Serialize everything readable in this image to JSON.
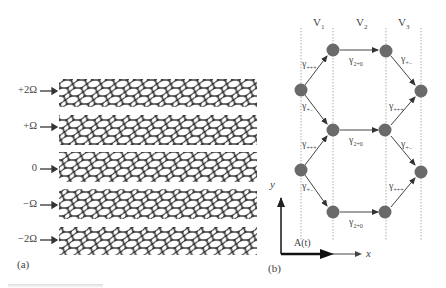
{
  "panel_a": {
    "label": "(a)",
    "sheets": [
      {
        "label": "+2Ω",
        "shade": "#b8b8b8",
        "top": 79
      },
      {
        "label": "+Ω",
        "shade": "#6e6e6e",
        "top": 116
      },
      {
        "label": "0",
        "shade": "#3a3a3a",
        "top": 153
      },
      {
        "label": "−Ω",
        "shade": "#6e6e6e",
        "top": 190
      },
      {
        "label": "−2Ω",
        "shade": "#b8b8b8",
        "top": 227
      }
    ]
  },
  "panel_b": {
    "label": "(b)",
    "columns": [
      {
        "label": "V",
        "sub": "1"
      },
      {
        "label": "V",
        "sub": "2"
      },
      {
        "label": "V",
        "sub": "3"
      }
    ],
    "edge_labels": {
      "gamma_plus_plus": {
        "symbol": "γ",
        "sub": "+++"
      },
      "gamma_plus_minus": {
        "symbol": "γ",
        "sub": "+−"
      },
      "gamma_two_zero": {
        "symbol": "γ",
        "sub": "2+0"
      }
    },
    "axes": {
      "x": "x",
      "y": "y",
      "field": "A(t)"
    },
    "node_color": "#6a6a6a"
  }
}
